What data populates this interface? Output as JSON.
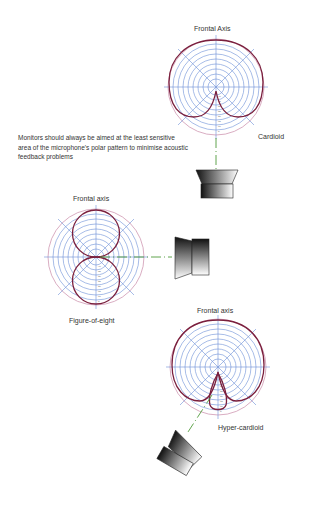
{
  "caption": "Monitors should always be aimed at the least sensitive area of the microphone's polar pattern to minimise acoustic feedback problems",
  "diagrams": [
    {
      "pattern": "Cardioid",
      "axis_label": "Frontal Axis",
      "name_label": "Cardioid",
      "monitor_position": "rear (180°)"
    },
    {
      "pattern": "Figure-of-eight",
      "axis_label": "Frontal axis",
      "name_label": "Figure-of-eight",
      "monitor_position": "side (90°)"
    },
    {
      "pattern": "Hyper-cardioid",
      "axis_label": "Frontal axis",
      "name_label": "Hyper-cardioid",
      "monitor_position": "rear off-axis (~150°)"
    }
  ],
  "colors": {
    "pattern": "#7a1f3d",
    "grid": "#6b8fd6",
    "outer_ring": "#c98aa8",
    "axis_line": "#4f9a3a"
  },
  "icons": {
    "monitor": "speaker-wedge-icon"
  }
}
